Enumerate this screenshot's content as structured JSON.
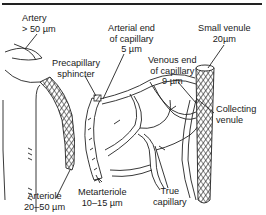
{
  "diagram": {
    "labels": {
      "artery": {
        "line1": "Artery",
        "line2": "> 50 µm"
      },
      "precapillary_sphincter": {
        "line1": "Precapillary",
        "line2": "sphincter"
      },
      "arterial_end": {
        "line1": "Arterial end",
        "line2": "of capillary",
        "line3": "5 µm"
      },
      "small_venule": {
        "line1": "Small venule",
        "line2": "20µm"
      },
      "venous_end": {
        "line1": "Venous end",
        "line2": "of capillary",
        "line3": "9 µm"
      },
      "collecting_venule": {
        "line1": "Collecting",
        "line2": "venule"
      },
      "arteriole": {
        "line1": "Arteriole",
        "line2": "20–50 µm"
      },
      "metarteriole": {
        "line1": "Metarteriole",
        "line2": "10–15 µm"
      },
      "true_capillary": {
        "line1": "True",
        "line2": "capillary"
      }
    },
    "colors": {
      "ink": "#1a1a1a",
      "background": "#ffffff"
    }
  }
}
